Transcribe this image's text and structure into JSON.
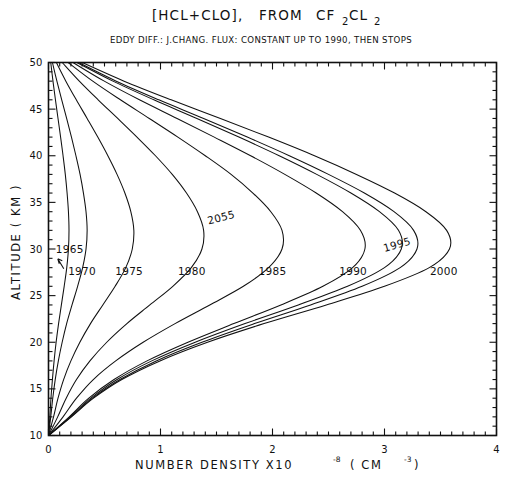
{
  "chart_data": {
    "type": "line",
    "title_parts": {
      "lead": "[HCL+CLO],",
      "from": "FROM",
      "species_a": "CF",
      "species_a_sub": "2",
      "species_b": "CL",
      "species_b_sub": "2"
    },
    "subtitle": "EDDY DIFF.: J.CHANG.  FLUX: CONSTANT UP TO 1990, THEN STOPS",
    "xlabel": "NUMBER DENSITY X10",
    "xlabel_exp": "-8",
    "xlabel_unit_open": "( CM",
    "xlabel_unit_exp": "-3",
    "xlabel_unit_close": " )",
    "ylabel": "ALTITUDE  ( KM )",
    "xlim": [
      0,
      4
    ],
    "ylim": [
      10,
      50
    ],
    "xticks": [
      0,
      1,
      2,
      3,
      4
    ],
    "xticklabels": [
      "0",
      "1",
      "2",
      "3",
      "4"
    ],
    "xtick_minor_step": 0.1,
    "yticks": [
      10,
      15,
      20,
      25,
      30,
      35,
      40,
      45,
      50
    ],
    "yticklabels": [
      "10",
      "15",
      "20",
      "25",
      "30",
      "35",
      "40",
      "45",
      "50"
    ],
    "ytick_minor_step": 1,
    "grid": false,
    "legend": "none",
    "line_color": "#111111",
    "background": "#ffffff",
    "annotations": [
      {
        "label": "1965",
        "x_data": 0.19,
        "y_data": 29.6,
        "rotation": 0,
        "pointer": true
      },
      {
        "label": "1970",
        "x_data": 0.3,
        "y_data": 27.2,
        "rotation": 0,
        "pointer": false
      },
      {
        "label": "1975",
        "x_data": 0.72,
        "y_data": 27.2,
        "rotation": 0,
        "pointer": false
      },
      {
        "label": "1980",
        "x_data": 1.28,
        "y_data": 27.2,
        "rotation": 0,
        "pointer": false
      },
      {
        "label": "1985",
        "x_data": 2.0,
        "y_data": 27.2,
        "rotation": 0,
        "pointer": false
      },
      {
        "label": "1990",
        "x_data": 2.72,
        "y_data": 27.2,
        "rotation": 0,
        "pointer": false
      },
      {
        "label": "1995",
        "x_data": 3.12,
        "y_data": 30.1,
        "rotation": -16,
        "pointer": false
      },
      {
        "label": "2000",
        "x_data": 3.53,
        "y_data": 27.2,
        "rotation": 0,
        "pointer": false
      },
      {
        "label": "2055",
        "x_data": 1.55,
        "y_data": 33.0,
        "rotation": -14,
        "pointer": false
      }
    ],
    "series": [
      {
        "name": "1965",
        "points": [
          [
            0.0,
            10.0
          ],
          [
            0.012,
            12.0
          ],
          [
            0.022,
            14.0
          ],
          [
            0.035,
            16.0
          ],
          [
            0.05,
            18.0
          ],
          [
            0.068,
            20.0
          ],
          [
            0.09,
            22.0
          ],
          [
            0.115,
            24.0
          ],
          [
            0.14,
            26.0
          ],
          [
            0.163,
            28.0
          ],
          [
            0.178,
            30.0
          ],
          [
            0.183,
            32.0
          ],
          [
            0.178,
            34.0
          ],
          [
            0.166,
            36.0
          ],
          [
            0.15,
            38.0
          ],
          [
            0.13,
            40.0
          ],
          [
            0.108,
            42.0
          ],
          [
            0.085,
            44.0
          ],
          [
            0.062,
            46.0
          ],
          [
            0.04,
            48.0
          ],
          [
            0.02,
            50.0
          ]
        ]
      },
      {
        "name": "1970",
        "points": [
          [
            0.0,
            10.0
          ],
          [
            0.02,
            12.0
          ],
          [
            0.038,
            14.0
          ],
          [
            0.06,
            16.0
          ],
          [
            0.088,
            18.0
          ],
          [
            0.122,
            20.0
          ],
          [
            0.162,
            22.0
          ],
          [
            0.21,
            24.0
          ],
          [
            0.26,
            26.0
          ],
          [
            0.305,
            28.0
          ],
          [
            0.335,
            30.0
          ],
          [
            0.345,
            32.0
          ],
          [
            0.335,
            34.0
          ],
          [
            0.312,
            36.0
          ],
          [
            0.282,
            38.0
          ],
          [
            0.245,
            40.0
          ],
          [
            0.205,
            42.0
          ],
          [
            0.162,
            44.0
          ],
          [
            0.118,
            46.0
          ],
          [
            0.075,
            48.0
          ],
          [
            0.035,
            50.0
          ]
        ]
      },
      {
        "name": "1975",
        "points": [
          [
            0.0,
            10.0
          ],
          [
            0.045,
            12.0
          ],
          [
            0.085,
            14.0
          ],
          [
            0.135,
            16.0
          ],
          [
            0.2,
            18.0
          ],
          [
            0.28,
            20.0
          ],
          [
            0.375,
            22.0
          ],
          [
            0.485,
            24.0
          ],
          [
            0.595,
            26.0
          ],
          [
            0.69,
            28.0
          ],
          [
            0.748,
            30.0
          ],
          [
            0.762,
            32.0
          ],
          [
            0.735,
            34.0
          ],
          [
            0.682,
            36.0
          ],
          [
            0.612,
            38.0
          ],
          [
            0.53,
            40.0
          ],
          [
            0.44,
            42.0
          ],
          [
            0.345,
            44.0
          ],
          [
            0.248,
            46.0
          ],
          [
            0.155,
            48.0
          ],
          [
            0.07,
            50.0
          ]
        ]
      },
      {
        "name": "1980",
        "points": [
          [
            0.0,
            10.0
          ],
          [
            0.082,
            12.0
          ],
          [
            0.158,
            14.0
          ],
          [
            0.25,
            16.0
          ],
          [
            0.37,
            18.0
          ],
          [
            0.52,
            20.0
          ],
          [
            0.7,
            22.0
          ],
          [
            0.905,
            24.0
          ],
          [
            1.11,
            26.0
          ],
          [
            1.275,
            28.0
          ],
          [
            1.37,
            30.0
          ],
          [
            1.385,
            32.0
          ],
          [
            1.33,
            34.0
          ],
          [
            1.232,
            36.0
          ],
          [
            1.105,
            38.0
          ],
          [
            0.955,
            40.0
          ],
          [
            0.79,
            42.0
          ],
          [
            0.618,
            44.0
          ],
          [
            0.443,
            46.0
          ],
          [
            0.275,
            48.0
          ],
          [
            0.122,
            50.0
          ]
        ]
      },
      {
        "name": "1985",
        "points": [
          [
            0.0,
            10.0
          ],
          [
            0.13,
            12.0
          ],
          [
            0.25,
            14.0
          ],
          [
            0.4,
            16.0
          ],
          [
            0.6,
            18.0
          ],
          [
            0.845,
            20.0
          ],
          [
            1.13,
            22.0
          ],
          [
            1.44,
            24.0
          ],
          [
            1.74,
            26.0
          ],
          [
            1.965,
            28.0
          ],
          [
            2.085,
            30.0
          ],
          [
            2.085,
            32.0
          ],
          [
            1.985,
            34.0
          ],
          [
            1.825,
            36.0
          ],
          [
            1.63,
            38.0
          ],
          [
            1.4,
            40.0
          ],
          [
            1.155,
            42.0
          ],
          [
            0.9,
            44.0
          ],
          [
            0.642,
            46.0
          ],
          [
            0.395,
            48.0
          ],
          [
            0.175,
            50.0
          ]
        ]
      },
      {
        "name": "1990",
        "points": [
          [
            0.0,
            10.0
          ],
          [
            0.185,
            12.0
          ],
          [
            0.36,
            14.0
          ],
          [
            0.585,
            16.0
          ],
          [
            0.88,
            18.0
          ],
          [
            1.245,
            20.0
          ],
          [
            1.655,
            22.0
          ],
          [
            2.075,
            24.0
          ],
          [
            2.45,
            26.0
          ],
          [
            2.715,
            28.0
          ],
          [
            2.825,
            30.0
          ],
          [
            2.785,
            32.0
          ],
          [
            2.625,
            34.0
          ],
          [
            2.39,
            36.0
          ],
          [
            2.11,
            38.0
          ],
          [
            1.805,
            40.0
          ],
          [
            1.48,
            42.0
          ],
          [
            1.148,
            44.0
          ],
          [
            0.812,
            46.0
          ],
          [
            0.498,
            48.0
          ],
          [
            0.218,
            50.0
          ]
        ]
      },
      {
        "name": "1995",
        "points": [
          [
            0.0,
            10.0
          ],
          [
            0.2,
            12.0
          ],
          [
            0.392,
            14.0
          ],
          [
            0.638,
            16.0
          ],
          [
            0.962,
            18.0
          ],
          [
            1.37,
            20.0
          ],
          [
            1.84,
            22.0
          ],
          [
            2.34,
            24.0
          ],
          [
            2.8,
            26.0
          ],
          [
            3.14,
            28.0
          ],
          [
            3.29,
            30.0
          ],
          [
            3.26,
            32.0
          ],
          [
            3.085,
            34.0
          ],
          [
            2.82,
            36.0
          ],
          [
            2.5,
            38.0
          ],
          [
            2.15,
            40.0
          ],
          [
            1.775,
            42.0
          ],
          [
            1.385,
            44.0
          ],
          [
            0.985,
            46.0
          ],
          [
            0.605,
            48.0
          ],
          [
            0.268,
            50.0
          ]
        ]
      },
      {
        "name": "2000",
        "points": [
          [
            0.0,
            10.0
          ],
          [
            0.205,
            12.0
          ],
          [
            0.402,
            14.0
          ],
          [
            0.655,
            16.0
          ],
          [
            0.995,
            18.0
          ],
          [
            1.42,
            20.0
          ],
          [
            1.925,
            22.0
          ],
          [
            2.48,
            24.0
          ],
          [
            3.0,
            26.0
          ],
          [
            3.4,
            28.0
          ],
          [
            3.58,
            30.0
          ],
          [
            3.555,
            32.0
          ],
          [
            3.37,
            34.0
          ],
          [
            3.09,
            36.0
          ],
          [
            2.75,
            38.0
          ],
          [
            2.375,
            40.0
          ],
          [
            1.965,
            42.0
          ],
          [
            1.535,
            44.0
          ],
          [
            1.095,
            46.0
          ],
          [
            0.675,
            48.0
          ],
          [
            0.3,
            50.0
          ]
        ]
      },
      {
        "name": "2055",
        "points": [
          [
            0.0,
            10.0
          ],
          [
            0.192,
            12.0
          ],
          [
            0.378,
            14.0
          ],
          [
            0.612,
            16.0
          ],
          [
            0.922,
            18.0
          ],
          [
            1.31,
            20.0
          ],
          [
            1.755,
            22.0
          ],
          [
            2.23,
            24.0
          ],
          [
            2.67,
            26.0
          ],
          [
            3.0,
            28.0
          ],
          [
            3.15,
            30.0
          ],
          [
            3.125,
            32.0
          ],
          [
            2.955,
            34.0
          ],
          [
            2.7,
            36.0
          ],
          [
            2.395,
            38.0
          ],
          [
            2.06,
            40.0
          ],
          [
            1.7,
            42.0
          ],
          [
            1.325,
            44.0
          ],
          [
            0.94,
            46.0
          ],
          [
            0.575,
            48.0
          ],
          [
            0.252,
            50.0
          ]
        ]
      }
    ]
  },
  "figure": {
    "caption_title_visible": true
  }
}
